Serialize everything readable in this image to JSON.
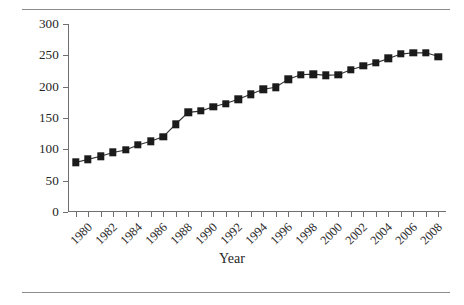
{
  "chart_data": {
    "type": "line",
    "title": "",
    "xlabel": "Year",
    "ylabel": "Inmates per 100,000",
    "xlim": [
      1979.4,
      2009.6
    ],
    "ylim": [
      0,
      300
    ],
    "grid": false,
    "legend": null,
    "y_ticks": [
      0,
      50,
      100,
      150,
      200,
      250,
      300
    ],
    "y_tick_labels": [
      "0",
      "50",
      "100",
      "150",
      "200",
      "250",
      "300"
    ],
    "x_ticks": [
      1980,
      1981,
      1982,
      1983,
      1984,
      1985,
      1986,
      1987,
      1988,
      1989,
      1990,
      1991,
      1992,
      1993,
      1994,
      1995,
      1996,
      1997,
      1998,
      1999,
      2000,
      2001,
      2002,
      2003,
      2004,
      2005,
      2006,
      2007,
      2008,
      2009
    ],
    "x_tick_labels": [
      "1980",
      "",
      "1982",
      "",
      "1984",
      "",
      "1986",
      "",
      "1988",
      "",
      "1990",
      "",
      "1992",
      "",
      "1994",
      "",
      "1996",
      "",
      "1998",
      "",
      "2000",
      "",
      "2002",
      "",
      "2004",
      "",
      "2006",
      "",
      "2008",
      ""
    ],
    "marker": "square",
    "marker_color": "#1b1b1b",
    "line_color": "#303030",
    "x": [
      1980,
      1981,
      1982,
      1983,
      1984,
      1985,
      1986,
      1987,
      1988,
      1989,
      1990,
      1991,
      1992,
      1993,
      1994,
      1995,
      1996,
      1997,
      1998,
      1999,
      2000,
      2001,
      2002,
      2003,
      2004,
      2005,
      2006,
      2007,
      2008,
      2009
    ],
    "values": [
      79,
      84,
      89,
      95,
      99,
      107,
      113,
      120,
      140,
      159,
      161,
      168,
      173,
      180,
      188,
      196,
      199,
      212,
      219,
      220,
      218,
      219,
      227,
      233,
      238,
      245,
      252,
      254,
      254,
      248
    ]
  },
  "figure": {
    "rule_color": "#8d8d8d",
    "background": "#ffffff"
  }
}
